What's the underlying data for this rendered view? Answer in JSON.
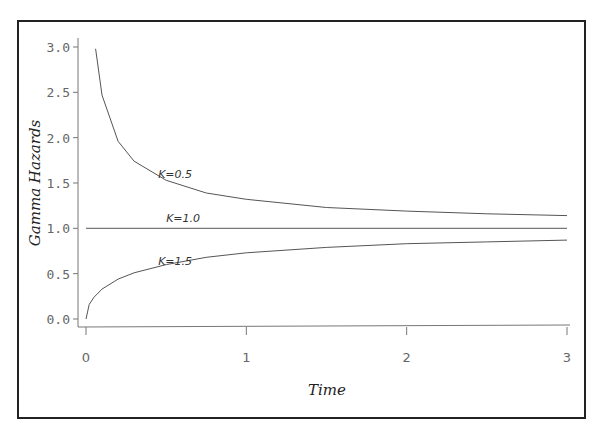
{
  "chart_data": {
    "type": "line",
    "title": "",
    "xlabel": "Time",
    "ylabel": "Gamma Hazards",
    "xlim": [
      0,
      3
    ],
    "ylim": [
      0,
      3
    ],
    "x_ticks": [
      0,
      1,
      2,
      3
    ],
    "x_tick_labels": [
      "0",
      "1",
      "2",
      "3"
    ],
    "y_ticks": [
      0.0,
      0.5,
      1.0,
      1.5,
      2.0,
      2.5,
      3.0
    ],
    "y_tick_labels": [
      "0.0",
      "0.5",
      "1.0",
      "1.5",
      "2.0",
      "2.5",
      "3.0"
    ],
    "grid": false,
    "legend": "none (inline curve annotations)",
    "series": [
      {
        "name": "K=0.5",
        "x": [
          0.06,
          0.1,
          0.2,
          0.3,
          0.5,
          0.75,
          1.0,
          1.5,
          2.0,
          2.5,
          3.0
        ],
        "y": [
          2.98,
          2.47,
          1.96,
          1.74,
          1.53,
          1.39,
          1.32,
          1.23,
          1.19,
          1.16,
          1.14
        ],
        "label_pos": {
          "x": 0.45,
          "y": 1.55
        }
      },
      {
        "name": "K=1.0",
        "x": [
          0.0,
          3.0
        ],
        "y": [
          1.0,
          1.0
        ],
        "label_pos": {
          "x": 0.5,
          "y": 1.07
        }
      },
      {
        "name": "K=1.5",
        "x": [
          0.0,
          0.02,
          0.05,
          0.1,
          0.2,
          0.3,
          0.5,
          0.75,
          1.0,
          1.5,
          2.0,
          2.5,
          3.0
        ],
        "y": [
          0.0,
          0.16,
          0.24,
          0.33,
          0.44,
          0.51,
          0.6,
          0.68,
          0.73,
          0.79,
          0.83,
          0.85,
          0.87
        ],
        "label_pos": {
          "x": 0.45,
          "y": 0.6
        }
      }
    ]
  },
  "annotations": {
    "k05": "K=0.5",
    "k10": "K=1.0",
    "k15": "K=1.5"
  },
  "axes": {
    "xlabel": "Time",
    "ylabel": "Gamma Hazards"
  }
}
